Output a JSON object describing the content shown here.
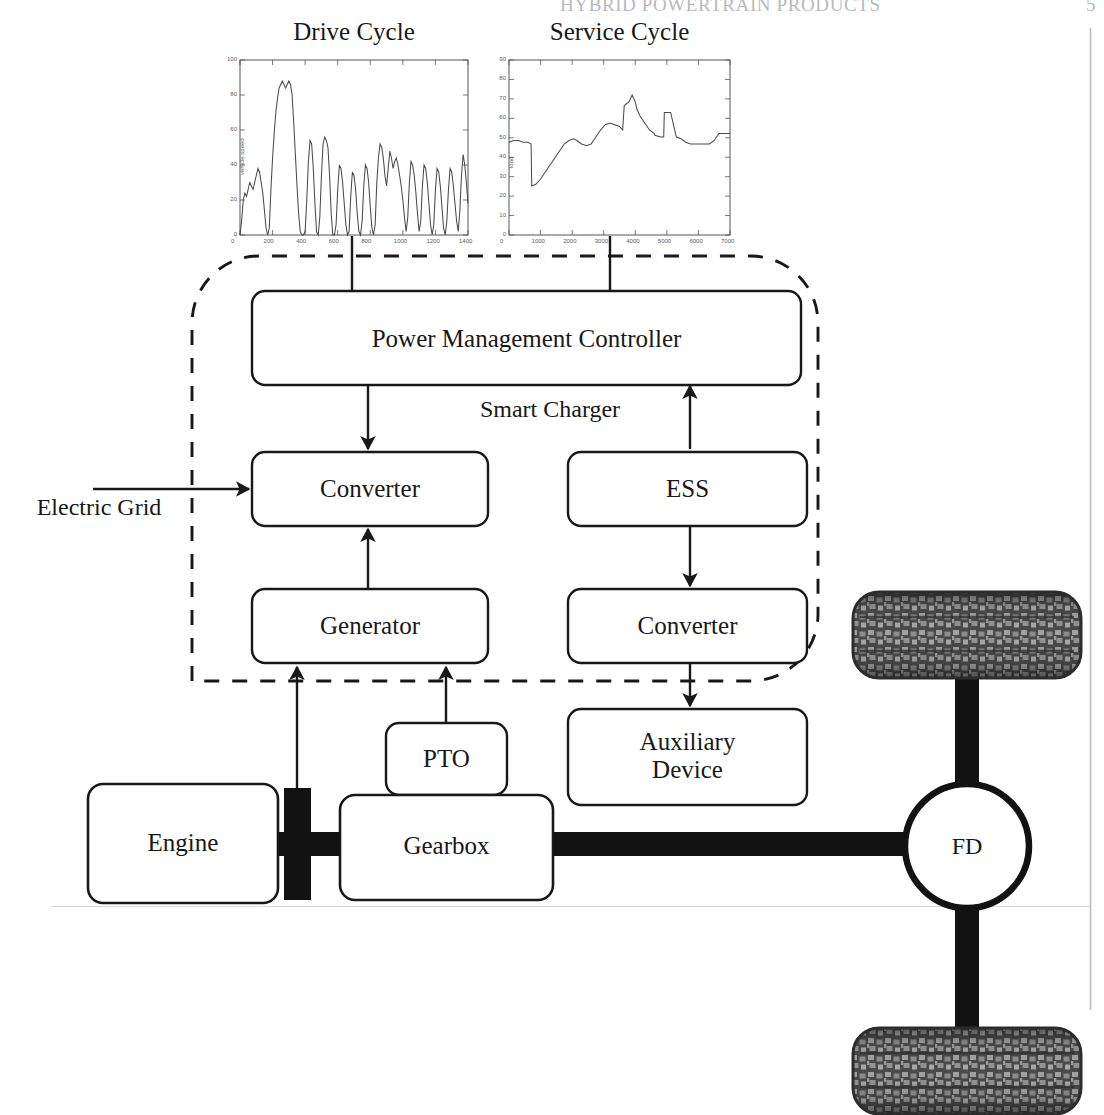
{
  "page": {
    "running_head": "HYBRID POWERTRAIN PRODUCTS",
    "page_number": "5",
    "background": "#ffffff",
    "ink": "#181818"
  },
  "charts": [
    {
      "id": "drive-cycle",
      "title": "Drive Cycle",
      "chart_data": {
        "type": "line",
        "title": "Drive Cycle",
        "xlabel": "time, s",
        "ylabel": "vehicle speed",
        "xlim": [
          0,
          1400
        ],
        "ylim": [
          0,
          100
        ],
        "grid": false,
        "legend": "none",
        "xticks": [
          "0",
          "200",
          "400",
          "600",
          "800",
          "1000",
          "1200",
          "1400"
        ],
        "yticks": [
          "0",
          "20",
          "40",
          "60",
          "80",
          "100"
        ],
        "x": [
          0,
          10,
          20,
          30,
          40,
          50,
          60,
          70,
          80,
          90,
          100,
          110,
          120,
          130,
          140,
          150,
          160,
          170,
          180,
          190,
          200,
          210,
          220,
          230,
          240,
          250,
          260,
          270,
          280,
          290,
          300,
          310,
          320,
          330,
          340,
          350,
          360,
          370,
          380,
          390,
          400,
          410,
          420,
          430,
          440,
          450,
          460,
          470,
          480,
          490,
          500,
          510,
          520,
          530,
          540,
          550,
          560,
          570,
          580,
          590,
          600,
          610,
          620,
          630,
          640,
          650,
          660,
          670,
          680,
          690,
          700,
          710,
          720,
          730,
          740,
          750,
          760,
          770,
          780,
          790,
          800,
          810,
          820,
          830,
          840,
          850,
          860,
          870,
          880,
          890,
          900,
          910,
          920,
          930,
          940,
          950,
          960,
          970,
          980,
          990,
          1000,
          1010,
          1020,
          1030,
          1040,
          1050,
          1060,
          1070,
          1080,
          1090,
          1100,
          1110,
          1120,
          1130,
          1140,
          1150,
          1160,
          1170,
          1180,
          1190,
          1200,
          1210,
          1220,
          1230,
          1240,
          1250,
          1260,
          1270,
          1280,
          1290,
          1300,
          1310,
          1320,
          1330,
          1340,
          1350,
          1360,
          1370,
          1380,
          1390,
          1400
        ],
        "values": [
          0,
          8,
          20,
          24,
          22,
          26,
          30,
          28,
          26,
          30,
          34,
          38,
          36,
          30,
          24,
          14,
          4,
          0,
          4,
          26,
          44,
          58,
          70,
          78,
          84,
          86,
          88,
          86,
          84,
          86,
          88,
          86,
          80,
          64,
          46,
          28,
          12,
          2,
          0,
          0,
          2,
          20,
          42,
          54,
          52,
          38,
          18,
          2,
          0,
          10,
          34,
          52,
          56,
          54,
          50,
          34,
          12,
          0,
          0,
          6,
          26,
          40,
          38,
          30,
          18,
          6,
          0,
          2,
          22,
          36,
          34,
          26,
          12,
          2,
          0,
          8,
          28,
          40,
          38,
          30,
          16,
          4,
          0,
          6,
          30,
          44,
          52,
          50,
          44,
          34,
          28,
          38,
          48,
          44,
          38,
          42,
          44,
          40,
          34,
          28,
          20,
          10,
          2,
          10,
          30,
          42,
          40,
          34,
          24,
          12,
          2,
          8,
          28,
          40,
          38,
          30,
          18,
          6,
          0,
          6,
          26,
          38,
          36,
          28,
          16,
          4,
          0,
          8,
          26,
          38,
          36,
          28,
          18,
          8,
          2,
          14,
          34,
          46,
          40,
          30,
          18,
          8,
          24,
          30,
          26
        ]
      }
    },
    {
      "id": "service-cycle",
      "title": "Service Cycle",
      "chart_data": {
        "type": "line",
        "title": "Service Cycle",
        "xlabel": "time, s",
        "ylabel": "load",
        "xlim": [
          0,
          7000
        ],
        "ylim": [
          0,
          100
        ],
        "grid": false,
        "legend": "none",
        "xticks": [
          "0",
          "1000",
          "2000",
          "3000",
          "4000",
          "5000",
          "6000",
          "7000"
        ],
        "yticks": [
          "0",
          "10",
          "20",
          "30",
          "40",
          "50",
          "60",
          "70",
          "80",
          "90"
        ],
        "x": [
          0,
          150,
          300,
          450,
          600,
          700,
          720,
          850,
          1000,
          1150,
          1300,
          1450,
          1600,
          1750,
          1900,
          2050,
          2150,
          2300,
          2450,
          2600,
          2750,
          2900,
          3050,
          3200,
          3350,
          3500,
          3600,
          3650,
          3800,
          3850,
          3900,
          4000,
          4050,
          4150,
          4300,
          4450,
          4600,
          4620,
          4800,
          4900,
          4920,
          5100,
          5120,
          5300,
          5450,
          5600,
          5750,
          5900,
          6050,
          6200,
          6350,
          6500,
          6650,
          6800,
          7000
        ],
        "values": [
          53,
          54,
          54,
          53,
          53,
          52,
          28,
          29,
          32,
          36,
          40,
          44,
          48,
          52,
          54,
          55,
          54,
          52,
          51,
          52,
          56,
          60,
          63,
          64,
          63,
          62,
          60,
          74,
          76,
          78,
          80,
          76,
          72,
          68,
          64,
          60,
          58,
          57,
          56,
          56,
          70,
          70,
          70,
          56,
          55,
          53,
          52,
          52,
          52,
          52,
          52,
          54,
          58,
          58,
          58
        ]
      }
    }
  ],
  "boundary": {
    "name": "hybrid-system-boundary",
    "style": "dashed",
    "note": ""
  },
  "blocks": [
    {
      "id": "power-management-controller",
      "label": "Power Management Controller"
    },
    {
      "id": "converter-grid",
      "label": "Converter"
    },
    {
      "id": "ess",
      "label": "ESS"
    },
    {
      "id": "generator",
      "label": "Generator"
    },
    {
      "id": "converter-aux",
      "label": "Converter"
    },
    {
      "id": "auxiliary-device",
      "label": "Auxiliary\nDevice"
    },
    {
      "id": "pto",
      "label": "PTO"
    },
    {
      "id": "engine",
      "label": "Engine"
    },
    {
      "id": "gearbox",
      "label": "Gearbox"
    },
    {
      "id": "final-drive",
      "label": "FD"
    }
  ],
  "labels": {
    "smart_charger": "Smart Charger",
    "electric_grid": "Electric Grid"
  },
  "wheels": [
    {
      "id": "wheel-front",
      "label": ""
    },
    {
      "id": "wheel-rear",
      "label": ""
    }
  ],
  "colors": {
    "ink": "#181818",
    "shaft": "#111111",
    "tire_dark": "#3b3b3b",
    "tire_light": "#9a9a9a",
    "page_rule": "#b9b9bd",
    "plot_line": "#4a4a4a"
  }
}
